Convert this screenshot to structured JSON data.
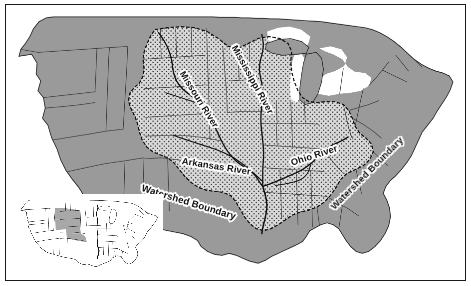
{
  "figure": {
    "title_visible": false,
    "background_color": "#ffffff",
    "frame_color": "#1a1a1a"
  },
  "map": {
    "region": "Contiguous United States",
    "colors": {
      "land_outside_watershed": "#9a9a9a",
      "watershed_fill": "#d8d8d8",
      "watershed_dot": "#3a3a3a",
      "state_border": "#3c3c3c",
      "coastline": "#2b2b2b",
      "river": "#111111",
      "watershed_boundary_line": "#111111",
      "water": "#ffffff"
    },
    "fill_legend": {
      "dotted_area_meaning": "Mississippi River watershed",
      "solid_gray_meaning": "Land outside watershed"
    },
    "labels": [
      {
        "name": "missouri-river-label",
        "text": "Missouri River",
        "rotation_deg": 58
      },
      {
        "name": "mississippi-river-label",
        "text": "Mississippi River",
        "rotation_deg": 61
      },
      {
        "name": "arkansas-river-label",
        "text": "Arkansas River",
        "rotation_deg": 9
      },
      {
        "name": "ohio-river-label",
        "text": "Ohio River",
        "rotation_deg": -18
      },
      {
        "name": "watershed-boundary-label-left",
        "text": "Watershed Boundary",
        "rotation_deg": 17
      },
      {
        "name": "watershed-boundary-label-right",
        "text": "Watershed Boundary",
        "rotation_deg": -45
      }
    ]
  },
  "inset": {
    "name": "locator-inset-map",
    "region": "Contiguous United States",
    "colors": {
      "land": "#ffffff",
      "highlight": "#a8a8a8",
      "outline": "#2b2b2b"
    },
    "highlighted_states": [
      "Montana",
      "North Dakota",
      "South Dakota",
      "Nebraska",
      "Iowa",
      "Missouri"
    ],
    "label_text": ""
  },
  "chart_data": {
    "type": "map",
    "title": "",
    "series": [
      {
        "name": "Mississippi River watershed",
        "symbol": "dotted light gray"
      },
      {
        "name": "Outside watershed",
        "symbol": "solid gray"
      }
    ],
    "annotations": [
      "Missouri River",
      "Mississippi River",
      "Arkansas River",
      "Ohio River",
      "Watershed Boundary",
      "Watershed Boundary"
    ]
  }
}
